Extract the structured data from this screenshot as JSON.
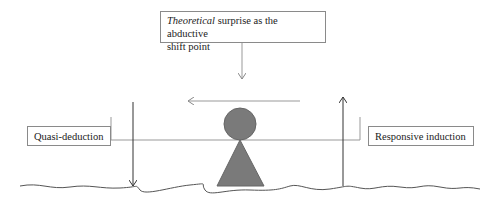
{
  "top_box": {
    "italic": "Theoretical",
    "rest": " surprise as the abductive",
    "line2": "shift point"
  },
  "left_box": {
    "label": "Quasi-deduction"
  },
  "right_box": {
    "label": "Responsive induction"
  },
  "colors": {
    "figure": "#7a7a7a",
    "line": "#999999",
    "arrow_dark": "#333333"
  }
}
